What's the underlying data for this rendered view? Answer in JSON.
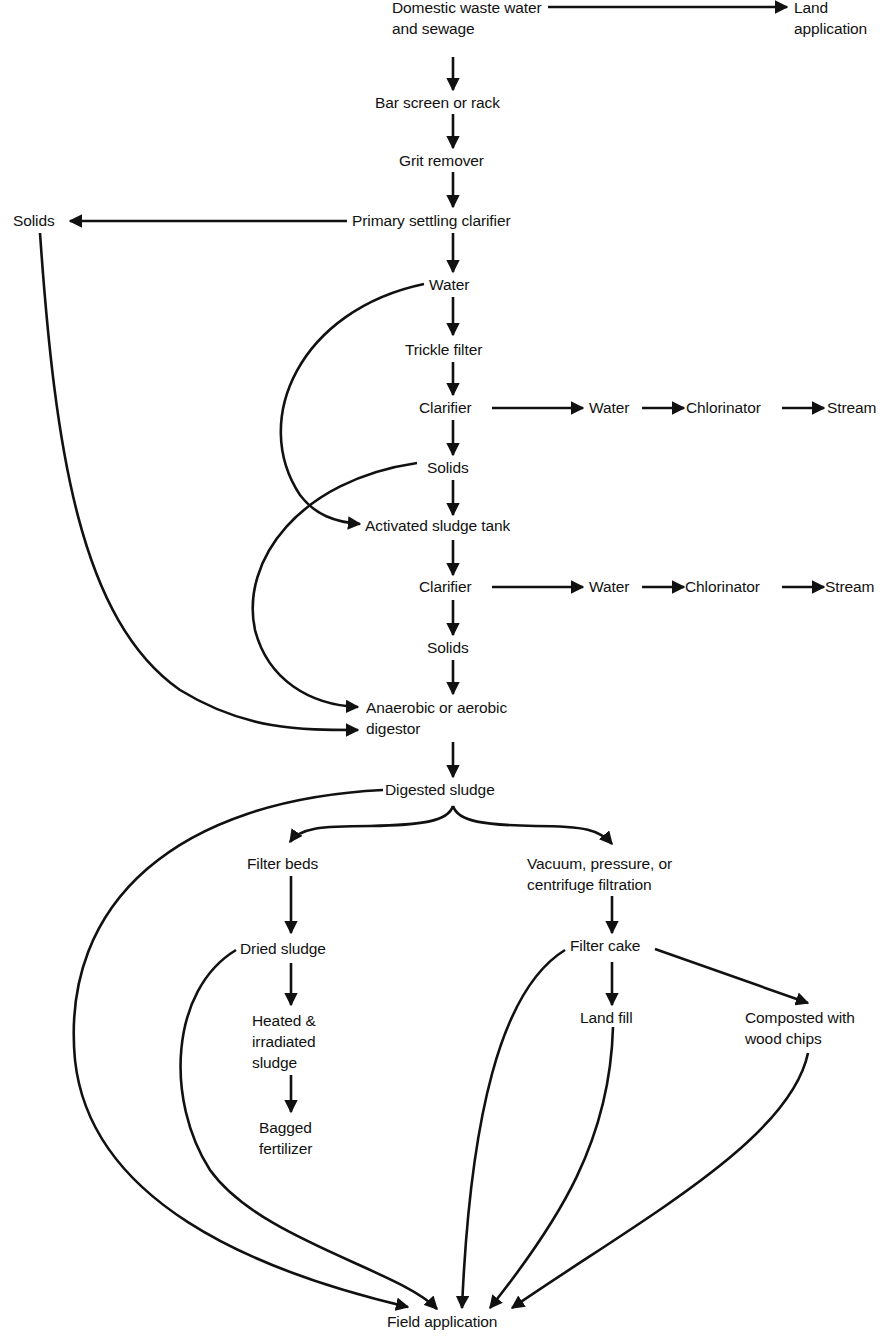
{
  "diagram": {
    "colors": {
      "ink": "#111111",
      "background": "#ffffff"
    },
    "nodes": {
      "domestic": "Domestic waste water\nand sewage",
      "land_application": "Land\napplication",
      "bar_screen": "Bar screen or rack",
      "grit_remover": "Grit remover",
      "primary_clarifier": "Primary settling clarifier",
      "solids_left": "Solids",
      "water1": "Water",
      "trickle_filter": "Trickle filter",
      "clarifier1": "Clarifier",
      "water_out1": "Water",
      "chlorinator1": "Chlorinator",
      "stream1": "Stream",
      "solids1": "Solids",
      "activated_sludge": "Activated sludge tank",
      "clarifier2": "Clarifier",
      "water_out2": "Water",
      "chlorinator2": "Chlorinator",
      "stream2": "Stream",
      "solids2": "Solids",
      "digestor": "Anaerobic or aerobic\ndigestor",
      "digested_sludge": "Digested sludge",
      "filter_beds": "Filter beds",
      "vacuum_filtration": "Vacuum, pressure, or\ncentrifuge filtration",
      "dried_sludge": "Dried sludge",
      "filter_cake": "Filter cake",
      "heated_sludge": "Heated &\nirradiated\nsludge",
      "land_fill": "Land fill",
      "composted": "Composted with\nwood chips",
      "bagged_fertilizer": "Bagged\nfertilizer",
      "field_application": "Field application"
    },
    "edges": [
      [
        "Domestic waste water and sewage",
        "Land application"
      ],
      [
        "Domestic waste water and sewage",
        "Bar screen or rack"
      ],
      [
        "Bar screen or rack",
        "Grit remover"
      ],
      [
        "Grit remover",
        "Primary settling clarifier"
      ],
      [
        "Primary settling clarifier",
        "Solids"
      ],
      [
        "Primary settling clarifier",
        "Water"
      ],
      [
        "Water",
        "Trickle filter"
      ],
      [
        "Water",
        "Activated sludge tank"
      ],
      [
        "Trickle filter",
        "Clarifier"
      ],
      [
        "Clarifier",
        "Water"
      ],
      [
        "Water",
        "Chlorinator"
      ],
      [
        "Chlorinator",
        "Stream"
      ],
      [
        "Clarifier",
        "Solids"
      ],
      [
        "Solids",
        "Activated sludge tank"
      ],
      [
        "Solids",
        "Anaerobic or aerobic digestor"
      ],
      [
        "Activated sludge tank",
        "Clarifier"
      ],
      [
        "Clarifier",
        "Solids"
      ],
      [
        "Solids",
        "Anaerobic or aerobic digestor"
      ],
      [
        "Solids (primary)",
        "Anaerobic or aerobic digestor"
      ],
      [
        "Anaerobic or aerobic digestor",
        "Digested sludge"
      ],
      [
        "Digested sludge",
        "Filter beds"
      ],
      [
        "Digested sludge",
        "Vacuum, pressure, or centrifuge filtration"
      ],
      [
        "Digested sludge",
        "Field application"
      ],
      [
        "Filter beds",
        "Dried sludge"
      ],
      [
        "Dried sludge",
        "Heated & irradiated sludge"
      ],
      [
        "Dried sludge",
        "Field application"
      ],
      [
        "Heated & irradiated sludge",
        "Bagged fertilizer"
      ],
      [
        "Vacuum, pressure, or centrifuge filtration",
        "Filter cake"
      ],
      [
        "Filter cake",
        "Land fill"
      ],
      [
        "Filter cake",
        "Composted with wood chips"
      ],
      [
        "Filter cake",
        "Field application"
      ],
      [
        "Land fill",
        "Field application"
      ],
      [
        "Composted with wood chips",
        "Field application"
      ]
    ]
  }
}
